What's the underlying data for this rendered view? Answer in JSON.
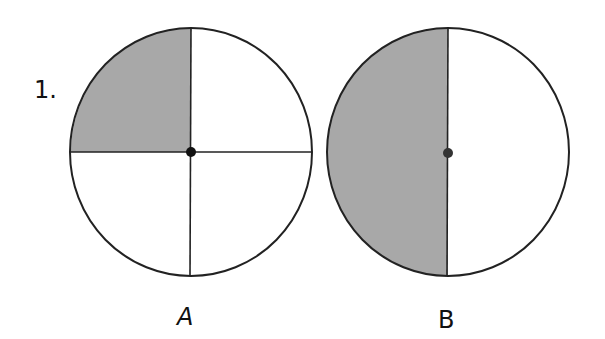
{
  "problem_number": "1.",
  "figures": [
    {
      "label": "A",
      "parts": 4,
      "shaded_parts": 1,
      "fraction": "1/4",
      "shading": "top-left quarter"
    },
    {
      "label": "B",
      "parts": 2,
      "shaded_parts": 1,
      "fraction": "1/2",
      "shading": "left half"
    }
  ],
  "colors": {
    "shade": "#a8a8a8",
    "stroke": "#222222",
    "background": "#ffffff"
  }
}
